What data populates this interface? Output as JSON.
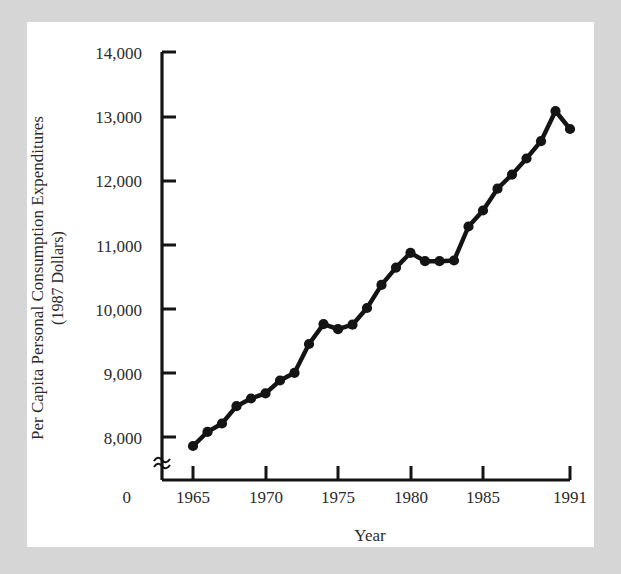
{
  "figure": {
    "title": "",
    "background_color": "#d6d6d6",
    "card_color": "#ffffff",
    "ink_color": "#141414"
  },
  "chart_data": {
    "type": "line",
    "title": "",
    "xlabel": "Year",
    "ylabel": "Per Capita Personal Consumption Expenditures (1987 Dollars)",
    "ylabel_line1": "Per Capita Personal Consumption Expenditures",
    "ylabel_line2": "(1987 Dollars)",
    "x": [
      1965,
      1966,
      1967,
      1968,
      1969,
      1970,
      1971,
      1972,
      1973,
      1974,
      1975,
      1976,
      1977,
      1978,
      1979,
      1980,
      1981,
      1982,
      1983,
      1984,
      1985,
      1986,
      1987,
      1988,
      1989,
      1990,
      1991
    ],
    "values": [
      7860,
      8080,
      8210,
      8480,
      8600,
      8680,
      8880,
      9000,
      9450,
      9760,
      9680,
      9750,
      10010,
      10370,
      10640,
      10870,
      10740,
      10740,
      10750,
      11280,
      11530,
      11870,
      12090,
      12340,
      12610,
      13080,
      12800
    ],
    "marker": "filled-circle",
    "line_color": "#141414",
    "grid": false,
    "legend": null,
    "xlim": [
      1964,
      1992
    ],
    "ylim": [
      7600,
      14000
    ],
    "yticks": [
      8000,
      9000,
      10000,
      11000,
      12000,
      13000,
      14000
    ],
    "ytick_labels": [
      "8,000",
      "9,000",
      "10,000",
      "11,000",
      "12,000",
      "13,000",
      "14,000"
    ],
    "y_origin_label": "0",
    "xticks": [
      1965,
      1970,
      1975,
      1980,
      1985,
      1991
    ],
    "xtick_labels": [
      "1965",
      "1970",
      "1975",
      "1980",
      "1985",
      "1991"
    ],
    "x_origin_label": "0",
    "axis_break": true,
    "axis_break_symbol": "≈"
  },
  "axes": {
    "y_title_line1": "Per Capita Personal Consumption Expenditures",
    "y_title_line2": "(1987 Dollars)",
    "x_title": "Year",
    "y_origin": "0",
    "x_origin": "0",
    "break_symbol": "≈"
  }
}
